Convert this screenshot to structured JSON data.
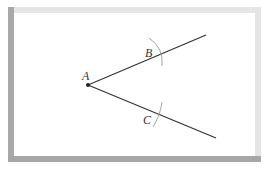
{
  "diagram": {
    "type": "geometric-construction",
    "points": {
      "A": {
        "label": "A",
        "x": 88,
        "y": 85
      },
      "B": {
        "label": "B",
        "x": 158,
        "y": 52
      },
      "C": {
        "label": "C",
        "x": 158,
        "y": 113
      }
    },
    "rays": [
      {
        "from": "A",
        "to": [
          206,
          35
        ]
      },
      {
        "from": "A",
        "to": [
          216,
          138
        ]
      }
    ],
    "colors": {
      "line": "#333333",
      "arc": "#999999",
      "frame_dark": "#a8a8a8",
      "frame_light": "#e5e5e5"
    }
  }
}
